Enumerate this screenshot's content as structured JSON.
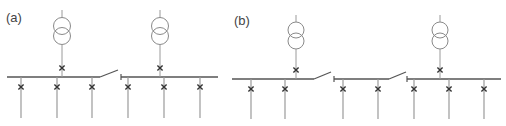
{
  "panels": [
    {
      "label": "(a)",
      "label_pos": [
        6,
        10
      ],
      "busbar_y": 77,
      "busbar_segments": [
        {
          "x1": 7,
          "x2": 100,
          "left_tick": false
        },
        {
          "x1": 121,
          "x2": 218,
          "left_tick": true
        }
      ],
      "bus_switches": [
        {
          "x1": 100,
          "x2": 118,
          "y_open": 70
        }
      ],
      "transformers": [
        {
          "x": 62,
          "top": 10,
          "circle_top_cy": 26,
          "circle_bot_cy": 36,
          "r": 8.5,
          "breaker_y": 68
        },
        {
          "x": 160,
          "top": 10,
          "circle_top_cy": 26,
          "circle_bot_cy": 36,
          "r": 8.5,
          "breaker_y": 68
        }
      ],
      "feeders": [
        {
          "x": 21,
          "breaker_y": 87,
          "bottom": 118
        },
        {
          "x": 57,
          "breaker_y": 87,
          "bottom": 118
        },
        {
          "x": 92,
          "breaker_y": 87,
          "bottom": 118
        },
        {
          "x": 128,
          "breaker_y": 87,
          "bottom": 118
        },
        {
          "x": 164,
          "breaker_y": 87,
          "bottom": 118
        },
        {
          "x": 200,
          "breaker_y": 87,
          "bottom": 118
        }
      ]
    },
    {
      "label": "(b)",
      "label_pos": [
        234,
        13
      ],
      "busbar_y": 79,
      "busbar_segments": [
        {
          "x1": 232,
          "x2": 314,
          "left_tick": false
        },
        {
          "x1": 334,
          "x2": 389,
          "left_tick": true
        },
        {
          "x1": 407,
          "x2": 501,
          "left_tick": true
        }
      ],
      "bus_switches": [
        {
          "x1": 314,
          "x2": 331,
          "y_open": 72
        },
        {
          "x1": 389,
          "x2": 406,
          "y_open": 72
        }
      ],
      "transformers": [
        {
          "x": 296,
          "top": 15,
          "circle_top_cy": 30,
          "circle_bot_cy": 41,
          "r": 8,
          "breaker_y": 70
        },
        {
          "x": 440,
          "top": 15,
          "circle_top_cy": 30,
          "circle_bot_cy": 41,
          "r": 8,
          "breaker_y": 70
        }
      ],
      "feeders": [
        {
          "x": 251,
          "breaker_y": 89,
          "bottom": 119
        },
        {
          "x": 285,
          "breaker_y": 89,
          "bottom": 119
        },
        {
          "x": 343,
          "breaker_y": 89,
          "bottom": 119
        },
        {
          "x": 378,
          "breaker_y": 89,
          "bottom": 119
        },
        {
          "x": 414,
          "breaker_y": 89,
          "bottom": 119
        },
        {
          "x": 449,
          "breaker_y": 89,
          "bottom": 119
        },
        {
          "x": 484,
          "breaker_y": 89,
          "bottom": 119
        }
      ]
    }
  ],
  "colors": {
    "busbar": "#555555",
    "lead": "#9a9a9a",
    "transformer": "#8a8a8a",
    "breaker": "#333333",
    "label": "#444444"
  }
}
